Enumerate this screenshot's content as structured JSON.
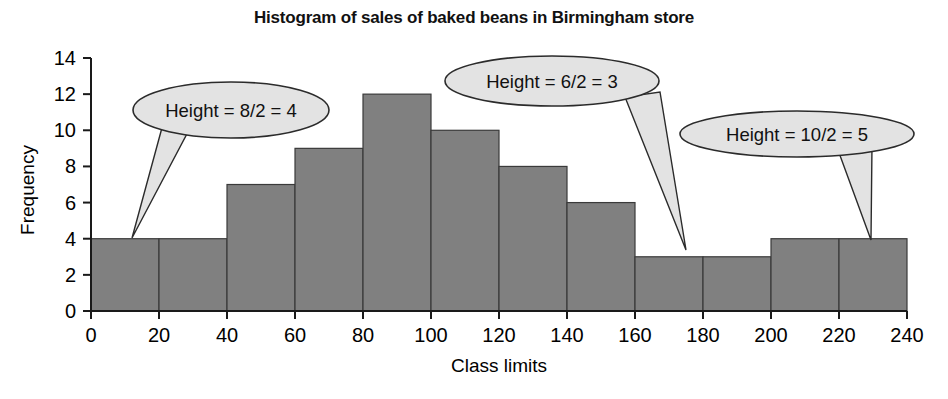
{
  "chart_data": {
    "type": "bar",
    "title": "Histogram of sales of baked beans in Birmingham store",
    "xlabel": "Class limits",
    "ylabel": "Frequency",
    "xlim": [
      0,
      240
    ],
    "ylim": [
      0,
      14
    ],
    "xticks": [
      "0",
      "20",
      "40",
      "60",
      "80",
      "100",
      "120",
      "140",
      "160",
      "180",
      "200",
      "220",
      "240"
    ],
    "yticks": [
      "0",
      "2",
      "4",
      "6",
      "8",
      "10",
      "12",
      "14"
    ],
    "grid": false,
    "legend": "none",
    "bin_width": 20,
    "categories": [
      "0-20",
      "20-40",
      "40-60",
      "60-80",
      "80-100",
      "100-120",
      "120-140",
      "140-160",
      "160-180",
      "180-200",
      "200-220",
      "220-240"
    ],
    "bin_edges": [
      0,
      20,
      40,
      60,
      80,
      100,
      120,
      140,
      160,
      180,
      200,
      220,
      240
    ],
    "values": [
      4,
      4,
      7,
      9,
      12,
      10,
      8,
      6,
      3,
      3,
      4,
      4
    ],
    "bar_fill_color": "#808080",
    "bar_border_color": "#3a3a3a",
    "annotations": [
      {
        "id": "callout-8-2-4",
        "text": "Height = 8/2 = 4"
      },
      {
        "id": "callout-6-2-3",
        "text": "Height = 6/2 = 3"
      },
      {
        "id": "callout-10-2-5",
        "text": "Height = 10/2 = 5"
      }
    ]
  },
  "callouts": {
    "first": {
      "text": "Height = 8/2 = 4"
    },
    "second": {
      "text": "Height = 6/2 = 3"
    },
    "third": {
      "text": "Height = 10/2 = 5"
    }
  },
  "colors": {
    "bar_fill": "#808080",
    "bar_border": "#3a3a3a",
    "callout_fill": "#e3e3e3",
    "callout_stroke": "#2b2b2b",
    "axis": "#1a1a1a"
  }
}
